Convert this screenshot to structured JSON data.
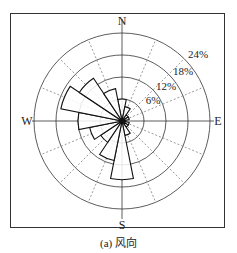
{
  "chart_data": {
    "type": "polar-bar",
    "title": "",
    "caption": "(a) 风向",
    "directions": [
      "N",
      "NNE",
      "NE",
      "ENE",
      "E",
      "ESE",
      "SE",
      "SSE",
      "S",
      "SSW",
      "SW",
      "WSW",
      "W",
      "WNW",
      "NW",
      "NNW"
    ],
    "values": [
      6,
      4,
      2,
      2,
      1,
      2,
      2,
      4,
      16,
      11,
      7,
      9,
      12,
      17,
      14,
      9
    ],
    "unit": "%",
    "rings": [
      6,
      12,
      18,
      24
    ],
    "ring_labels": [
      "6%",
      "12%",
      "18%",
      "24%"
    ],
    "axis_labels": {
      "N": "N",
      "E": "E",
      "S": "S",
      "W": "W"
    },
    "rlim": [
      0,
      24
    ],
    "grid": true
  }
}
